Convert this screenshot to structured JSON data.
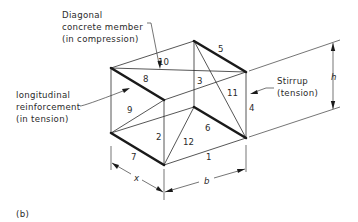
{
  "figure": {
    "panel_label": "(b)",
    "annotations": {
      "diagonal": [
        "Diagonal",
        "concrete member",
        "(in compression)"
      ],
      "longitudinal": [
        "longitudinal",
        "reinforcement",
        "(in tension)"
      ],
      "stirrup": [
        "Stirrup",
        "(tension)"
      ]
    },
    "dimensions": {
      "height": "h",
      "width": "b",
      "spacing": "x"
    },
    "members": [
      "1",
      "2",
      "3",
      "4",
      "5",
      "6",
      "7",
      "8",
      "9",
      "10",
      "11",
      "12"
    ],
    "colors": {
      "line": "#2b2b2b",
      "heavy_line": "#1a1a1a",
      "background": "#ffffff"
    }
  }
}
